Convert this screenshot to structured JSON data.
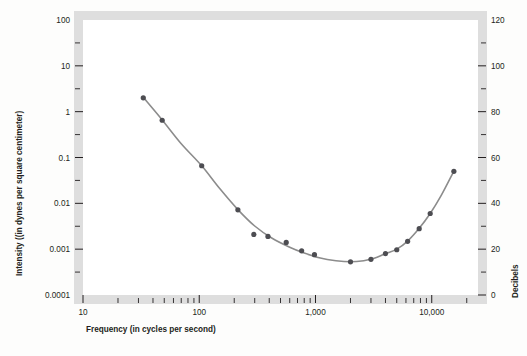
{
  "chart_data": {
    "type": "line",
    "title": "",
    "xlabel": "Frequency (in cycles per second)",
    "ylabel": "Intensity ((in dynes per square centimeter)",
    "y2label": "Decibels",
    "xscale": "log",
    "yscale": "log",
    "xlim": [
      10,
      25000
    ],
    "ylim": [
      0.0001,
      100
    ],
    "y2lim": [
      0,
      120
    ],
    "grid": false,
    "legend": null,
    "x_ticks": [
      {
        "value": 10,
        "label": "10",
        "major": true
      },
      {
        "value": 20,
        "label": "",
        "major": false
      },
      {
        "value": 30,
        "label": "",
        "major": false
      },
      {
        "value": 40,
        "label": "",
        "major": false
      },
      {
        "value": 50,
        "label": "",
        "major": false
      },
      {
        "value": 60,
        "label": "",
        "major": false
      },
      {
        "value": 70,
        "label": "",
        "major": false
      },
      {
        "value": 80,
        "label": "",
        "major": false
      },
      {
        "value": 90,
        "label": "",
        "major": false
      },
      {
        "value": 100,
        "label": "100",
        "major": true
      },
      {
        "value": 200,
        "label": "",
        "major": false
      },
      {
        "value": 300,
        "label": "",
        "major": false
      },
      {
        "value": 400,
        "label": "",
        "major": false
      },
      {
        "value": 500,
        "label": "",
        "major": false
      },
      {
        "value": 600,
        "label": "",
        "major": false
      },
      {
        "value": 700,
        "label": "",
        "major": false
      },
      {
        "value": 800,
        "label": "",
        "major": false
      },
      {
        "value": 900,
        "label": "",
        "major": false
      },
      {
        "value": 1000,
        "label": "1,000",
        "major": true
      },
      {
        "value": 2000,
        "label": "",
        "major": false
      },
      {
        "value": 3000,
        "label": "",
        "major": false
      },
      {
        "value": 4000,
        "label": "",
        "major": false
      },
      {
        "value": 5000,
        "label": "",
        "major": false
      },
      {
        "value": 6000,
        "label": "",
        "major": false
      },
      {
        "value": 7000,
        "label": "",
        "major": false
      },
      {
        "value": 8000,
        "label": "",
        "major": false
      },
      {
        "value": 9000,
        "label": "",
        "major": false
      },
      {
        "value": 10000,
        "label": "10,000",
        "major": true
      },
      {
        "value": 20000,
        "label": "",
        "major": false
      }
    ],
    "y_ticks": [
      {
        "value": 100,
        "label": "100",
        "major": true
      },
      {
        "value": 31.6227766,
        "label": "",
        "major": false
      },
      {
        "value": 10,
        "label": "10",
        "major": true
      },
      {
        "value": 3.16227766,
        "label": "",
        "major": false
      },
      {
        "value": 1,
        "label": "1",
        "major": true
      },
      {
        "value": 0.316227766,
        "label": "",
        "major": false
      },
      {
        "value": 0.1,
        "label": "0.1",
        "major": true
      },
      {
        "value": 0.0316227766,
        "label": "",
        "major": false
      },
      {
        "value": 0.01,
        "label": "0.01",
        "major": true
      },
      {
        "value": 0.00316227766,
        "label": "",
        "major": false
      },
      {
        "value": 0.001,
        "label": "0.001",
        "major": true
      },
      {
        "value": 0.000316227766,
        "label": "",
        "major": false
      },
      {
        "value": 0.0001,
        "label": "0.0001",
        "major": true
      }
    ],
    "y2_ticks": [
      {
        "value": 120,
        "label": "120",
        "major": true
      },
      {
        "value": 110,
        "label": "",
        "major": false
      },
      {
        "value": 100,
        "label": "100",
        "major": true
      },
      {
        "value": 90,
        "label": "",
        "major": false
      },
      {
        "value": 80,
        "label": "80",
        "major": true
      },
      {
        "value": 70,
        "label": "",
        "major": false
      },
      {
        "value": 60,
        "label": "60",
        "major": true
      },
      {
        "value": 50,
        "label": "",
        "major": false
      },
      {
        "value": 40,
        "label": "40",
        "major": true
      },
      {
        "value": 30,
        "label": "",
        "major": false
      },
      {
        "value": 20,
        "label": "20",
        "major": true
      },
      {
        "value": 10,
        "label": "",
        "major": false
      },
      {
        "value": 0,
        "label": "0",
        "major": true
      }
    ],
    "series": [
      {
        "name": "Threshold of hearing",
        "marker": "circle",
        "marker_color": "#4d4d52",
        "line_color": "#8c8c8c",
        "points": [
          {
            "x": 33,
            "y": 2.0,
            "db": 87
          },
          {
            "x": 48,
            "y": 0.65,
            "db": 78
          },
          {
            "x": 105,
            "y": 0.066,
            "db": 58
          },
          {
            "x": 215,
            "y": 0.0072,
            "db": 38
          },
          {
            "x": 295,
            "y": 0.0021,
            "db": 27
          },
          {
            "x": 390,
            "y": 0.0019,
            "db": 26
          },
          {
            "x": 560,
            "y": 0.0014,
            "db": 24
          },
          {
            "x": 760,
            "y": 0.00092,
            "db": 20
          },
          {
            "x": 980,
            "y": 0.00076,
            "db": 18
          },
          {
            "x": 2000,
            "y": 0.00053,
            "db": 15
          },
          {
            "x": 3000,
            "y": 0.0006,
            "db": 16
          },
          {
            "x": 4000,
            "y": 0.0008,
            "db": 18
          },
          {
            "x": 5000,
            "y": 0.00097,
            "db": 20
          },
          {
            "x": 6200,
            "y": 0.00148,
            "db": 23
          },
          {
            "x": 7800,
            "y": 0.0028,
            "db": 29
          },
          {
            "x": 9700,
            "y": 0.006,
            "db": 36
          },
          {
            "x": 15500,
            "y": 0.05,
            "db": 54
          }
        ]
      }
    ],
    "curve_path_points": [
      {
        "x": 33,
        "y": 2.05
      },
      {
        "x": 48,
        "y": 0.66
      },
      {
        "x": 70,
        "y": 0.2
      },
      {
        "x": 105,
        "y": 0.066
      },
      {
        "x": 150,
        "y": 0.021
      },
      {
        "x": 215,
        "y": 0.0073
      },
      {
        "x": 300,
        "y": 0.0032
      },
      {
        "x": 420,
        "y": 0.00175
      },
      {
        "x": 600,
        "y": 0.0011
      },
      {
        "x": 800,
        "y": 0.00082
      },
      {
        "x": 1100,
        "y": 0.00064
      },
      {
        "x": 1500,
        "y": 0.00056
      },
      {
        "x": 2000,
        "y": 0.00053
      },
      {
        "x": 2600,
        "y": 0.00056
      },
      {
        "x": 3200,
        "y": 0.00063
      },
      {
        "x": 4000,
        "y": 0.0008
      },
      {
        "x": 5000,
        "y": 0.001
      },
      {
        "x": 6200,
        "y": 0.0015
      },
      {
        "x": 7800,
        "y": 0.00285
      },
      {
        "x": 9700,
        "y": 0.006
      },
      {
        "x": 12000,
        "y": 0.0145
      },
      {
        "x": 15500,
        "y": 0.0505
      }
    ]
  },
  "colors": {
    "frame_band": "#dedede",
    "plot_background": "#ffffff",
    "page_background": "#fdfdfc",
    "curve": "#8c8c8c",
    "marker": "#4d4d52",
    "text": "#231f20"
  }
}
